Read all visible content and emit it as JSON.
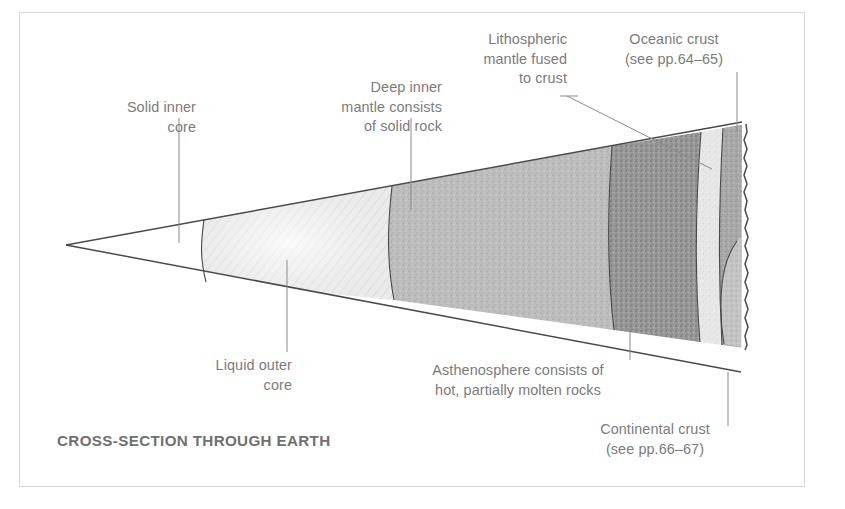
{
  "figure": {
    "title": "CROSS-SECTION THROUGH EARTH",
    "labels": {
      "solid_inner_core": "Solid inner\ncore",
      "liquid_outer_core": "Liquid outer\ncore",
      "deep_inner_mantle": "Deep inner\nmantle consists\nof solid rock",
      "lithospheric_mantle": "Lithospheric\nmantle fused\nto crust",
      "oceanic_crust": "Oceanic crust\n(see pp.64–65)",
      "asthenosphere": "Asthenosphere consists of\nhot, partially molten rocks",
      "continental_crust": "Continental crust\n(see pp.66–67)"
    },
    "colors": {
      "frame": "#d8d8d8",
      "outline": "#4a4a4a",
      "label_text": "#7b7b7b",
      "title_text": "#707070",
      "inner_core_fill": "#ffffff",
      "outer_core_fill": "#eeeeee",
      "deep_mantle_fill": "#b9b9b9",
      "asthenosphere_fill": "#949494",
      "lithospheric_mantle_fill": "#e6e6e6",
      "crust_fill": "#a8a8a8",
      "continental_crust_fill": "#c2c2c2",
      "background": "#ffffff"
    },
    "layers": [
      {
        "name": "solid-inner-core",
        "label_key": "solid_inner_core",
        "texture": "plain"
      },
      {
        "name": "liquid-outer-core",
        "label_key": "liquid_outer_core",
        "texture": "hatched"
      },
      {
        "name": "deep-inner-mantle",
        "label_key": "deep_inner_mantle",
        "texture": "fine-speckle"
      },
      {
        "name": "asthenosphere",
        "label_key": "asthenosphere",
        "texture": "coarse-speckle"
      },
      {
        "name": "lithospheric-mantle",
        "label_key": "lithospheric_mantle",
        "texture": "fine-speckle-light"
      },
      {
        "name": "oceanic-crust",
        "label_key": "oceanic_crust",
        "texture": "speckle"
      },
      {
        "name": "continental-crust",
        "label_key": "continental_crust",
        "texture": "speckle-light"
      }
    ]
  }
}
